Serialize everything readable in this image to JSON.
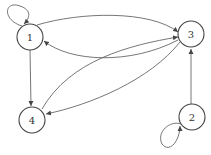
{
  "diagram": {
    "type": "directed-graph",
    "nodes": [
      {
        "id": "1",
        "label": "1",
        "cx": 30,
        "cy": 37
      },
      {
        "id": "2",
        "label": "2",
        "cx": 192,
        "cy": 117
      },
      {
        "id": "3",
        "label": "3",
        "cx": 191,
        "cy": 34
      },
      {
        "id": "4",
        "label": "4",
        "cx": 32,
        "cy": 120
      }
    ],
    "edges": [
      {
        "from": "1",
        "to": "1",
        "kind": "self-loop"
      },
      {
        "from": "1",
        "to": "3"
      },
      {
        "from": "3",
        "to": "1"
      },
      {
        "from": "1",
        "to": "4"
      },
      {
        "from": "4",
        "to": "3"
      },
      {
        "from": "3",
        "to": "4"
      },
      {
        "from": "2",
        "to": "3"
      },
      {
        "from": "2",
        "to": "2",
        "kind": "self-loop"
      }
    ],
    "colors": {
      "stroke": "#555555",
      "background": "#ffffff"
    }
  }
}
